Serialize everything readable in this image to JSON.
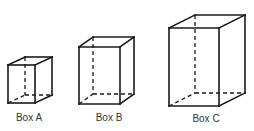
{
  "diagram": {
    "type": "3d-box-comparison",
    "boxes": [
      {
        "id": "A",
        "label": "Box A",
        "front": {
          "x": 8,
          "y": 65,
          "w": 27,
          "h": 38
        },
        "depth": {
          "dx": 17,
          "dy": -8
        }
      },
      {
        "id": "B",
        "label": "Box B",
        "front": {
          "x": 79,
          "y": 47,
          "w": 41,
          "h": 57
        },
        "depth": {
          "dx": 14,
          "dy": -10
        }
      },
      {
        "id": "C",
        "label": "Box C",
        "front": {
          "x": 169,
          "y": 28,
          "w": 50,
          "h": 78
        },
        "depth": {
          "dx": 26,
          "dy": -13
        }
      }
    ],
    "colors": {
      "line": "#1a1a1a",
      "label": "#333333",
      "background": "#ffffff"
    }
  }
}
